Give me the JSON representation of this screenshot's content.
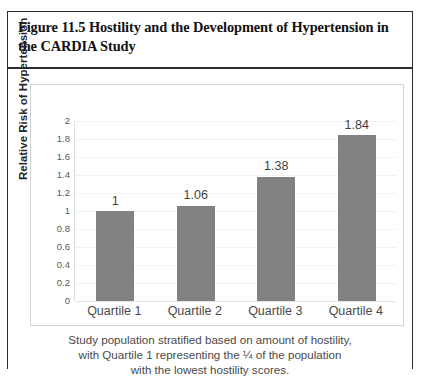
{
  "figure": {
    "title": "Figure 11.5 Hostility and the Development of Hypertension in the CARDIA Study",
    "caption_lines": [
      "Study population stratified based on amount of hostility,",
      "with Quartile 1 representing the ¼ of the population",
      "with the lowest hostility scores."
    ]
  },
  "colors": {
    "bar": "#828282",
    "frame": "#2b2b2b",
    "chart_border": "#d3d3d3",
    "gridline": "#f2f2f2",
    "text": "#4a4a4a"
  },
  "chart_data": {
    "type": "bar",
    "title": "",
    "xlabel": "",
    "ylabel": "Relative Risk of Hypertension",
    "categories": [
      "Quartile 1",
      "Quartile 2",
      "Quartile 3",
      "Quartile 4"
    ],
    "values": [
      1,
      1.06,
      1.38,
      1.84
    ],
    "data_labels": [
      "1",
      "1.06",
      "1.38",
      "1.84"
    ],
    "ylim": [
      0,
      2
    ],
    "ytick_step": 0.2,
    "ytick_labels": [
      "2",
      "1.8",
      "1.6",
      "1.4",
      "1.2",
      "1",
      "0.8",
      "0.6",
      "0.4",
      "0.2",
      "0"
    ],
    "ytick_values": [
      2,
      1.8,
      1.6,
      1.4,
      1.2,
      1,
      0.8,
      0.6,
      0.4,
      0.2,
      0
    ],
    "grid": true,
    "legend": false,
    "legend_position": "none",
    "series": [
      {
        "name": "Relative Risk of Hypertension",
        "values": [
          1,
          1.06,
          1.38,
          1.84
        ]
      }
    ]
  }
}
